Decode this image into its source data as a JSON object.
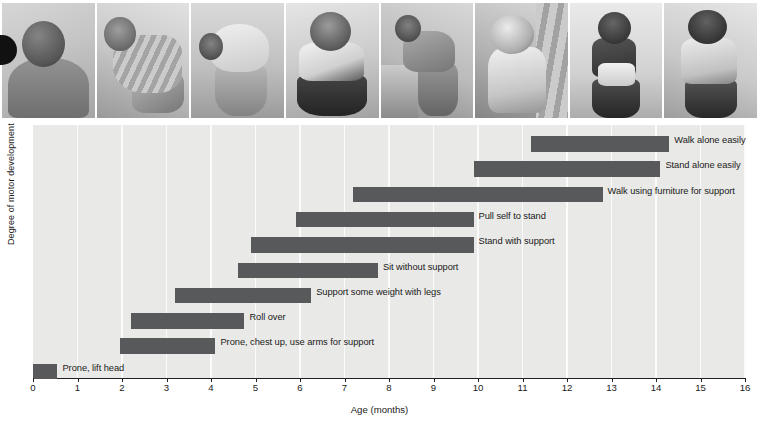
{
  "photos": [
    {
      "name": "baby-prone-lift-head",
      "alt": "Infant lying prone lifting head"
    },
    {
      "name": "baby-rolling-over",
      "alt": "Infant rolling over"
    },
    {
      "name": "baby-crawling",
      "alt": "Infant on hands and feet"
    },
    {
      "name": "baby-sitting-without-support",
      "alt": "Infant sitting unsupported"
    },
    {
      "name": "baby-pulling-self-to-stand",
      "alt": "Infant pulling up on furniture"
    },
    {
      "name": "baby-standing-with-support",
      "alt": "Infant standing holding drape"
    },
    {
      "name": "baby-walking-with-help",
      "alt": "Infant walking held by adult hands"
    },
    {
      "name": "baby-walking-alone",
      "alt": "Toddler walking alone"
    }
  ],
  "chart_data": {
    "type": "bar",
    "orientation": "horizontal",
    "subtype": "range-bar",
    "title": "",
    "xlabel": "Age (months)",
    "ylabel": "Degree of motor development",
    "xlim": [
      0,
      16
    ],
    "xticks": [
      0,
      1,
      2,
      3,
      4,
      5,
      6,
      7,
      8,
      9,
      10,
      11,
      12,
      13,
      14,
      15,
      16
    ],
    "xtick_labels": [
      "0",
      "1",
      "2",
      "3",
      "4",
      "5",
      "6",
      "7",
      "8",
      "9",
      "10",
      "11",
      "12",
      "13",
      "14",
      "15",
      "16"
    ],
    "grid": true,
    "legend": false,
    "bar_color": "#58595b",
    "plot_bg": "#e9e9e7",
    "gridline_color": "#fbfbfb",
    "categories": [
      "Walk alone easily",
      "Stand alone easily",
      "Walk using furniture for support",
      "Pull self to stand",
      "Stand with support",
      "Sit without support",
      "Support some weight with legs",
      "Roll over",
      "Prone, chest up, use arms for support",
      "Prone, lift head"
    ],
    "ranges": [
      {
        "milestone": "Walk alone easily",
        "start": 11.2,
        "end": 14.3
      },
      {
        "milestone": "Stand alone easily",
        "start": 9.9,
        "end": 14.1
      },
      {
        "milestone": "Walk using furniture for support",
        "start": 7.2,
        "end": 12.8
      },
      {
        "milestone": "Pull self to stand",
        "start": 5.9,
        "end": 9.9
      },
      {
        "milestone": "Stand with support",
        "start": 4.9,
        "end": 9.9
      },
      {
        "milestone": "Sit without support",
        "start": 4.6,
        "end": 7.75
      },
      {
        "milestone": "Support some weight with legs",
        "start": 3.2,
        "end": 6.25
      },
      {
        "milestone": "Roll over",
        "start": 2.2,
        "end": 4.75
      },
      {
        "milestone": "Prone, chest up, use arms for support",
        "start": 1.95,
        "end": 4.1
      },
      {
        "milestone": "Prone, lift head",
        "start": 0.0,
        "end": 0.55
      }
    ]
  }
}
